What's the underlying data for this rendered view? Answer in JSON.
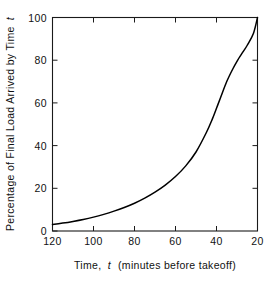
{
  "chart_data": {
    "type": "line",
    "title": "",
    "xlabel": "Time, t (minutes before takeoff)",
    "xlabel_prefix": "Time,",
    "xlabel_var": "t",
    "xlabel_suffix": "(minutes before takeoff)",
    "ylabel": "Percentage of Final Load Arrived by Time t",
    "ylabel_prefix": "Percentage of Final Load Arrived by Time",
    "ylabel_var": "t",
    "xlim": [
      120,
      20
    ],
    "ylim": [
      0,
      100
    ],
    "x_inverted": true,
    "grid": false,
    "legend": false,
    "legend_position": "none",
    "xticks": [
      120,
      100,
      80,
      60,
      40,
      20
    ],
    "xtick_labels": [
      "120",
      "100",
      "80",
      "60",
      "40",
      "20"
    ],
    "yticks": [
      0,
      20,
      40,
      60,
      80,
      100
    ],
    "ytick_labels": [
      "0",
      "20",
      "40",
      "60",
      "80",
      "100"
    ],
    "tick_direction": "in",
    "frame": "box",
    "line_color": "#000000",
    "axis_color": "#1a1a1a",
    "background_color": "#ffffff",
    "series": [
      {
        "name": "Percentage of final load arrived",
        "x": [
          120,
          115,
          110,
          105,
          100,
          95,
          90,
          85,
          80,
          75,
          70,
          65,
          60,
          55,
          50,
          45,
          42,
          40,
          38,
          35,
          32,
          30,
          27,
          25,
          22,
          20
        ],
        "values": [
          3,
          3.7,
          4.5,
          5.4,
          6.5,
          7.8,
          9.3,
          11.0,
          13.0,
          15.4,
          18.2,
          21.5,
          25.5,
          30.5,
          37.0,
          46.0,
          52.5,
          57.5,
          62.5,
          70.0,
          76.0,
          79.5,
          84.0,
          87.0,
          92.5,
          100
        ]
      }
    ]
  }
}
